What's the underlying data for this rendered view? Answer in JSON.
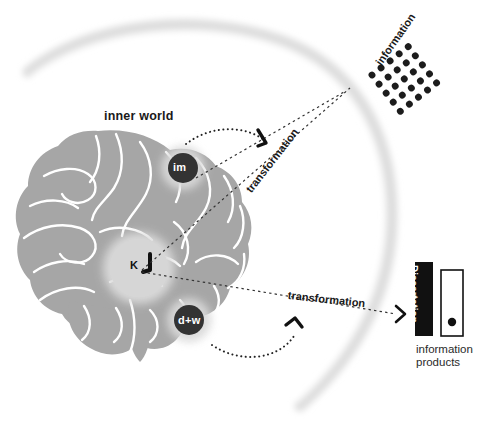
{
  "figure": {
    "type": "conceptual-diagram"
  },
  "labels": {
    "inner_world": "inner world",
    "information": "information",
    "transformation_upper": "transformation",
    "transformation_lower": "transformation",
    "information_products": "information\nproducts",
    "information_products_line1": "information",
    "information_products_line2": "products"
  },
  "nodes": [
    {
      "id": "im",
      "label": "im",
      "meaning": "information-mental-model-node"
    },
    {
      "id": "k",
      "label": "K",
      "meaning": "knowledge-node"
    },
    {
      "id": "dw",
      "label": "d+w",
      "meaning": "data-wisdom-node"
    }
  ],
  "artifacts": [
    {
      "id": "dissertation",
      "label": "Dissertation",
      "style": "black-spine"
    },
    {
      "id": "blank-product",
      "label": "",
      "style": "white-spine-with-dot"
    }
  ],
  "dot_grid": {
    "rows": 5,
    "cols": 5,
    "rotation_deg": -38,
    "dot_color": "#1c1c1c"
  },
  "colors": {
    "brain_fill": "#a6a6a6",
    "brain_lines": "#ffffff",
    "halo": "#cfcfcf",
    "node_dark": "#333333",
    "node_light": "#d4d4d4",
    "arc": "#dedede",
    "text": "#1a1a1a",
    "background": "#ffffff",
    "dissertation_spine": "#111111",
    "product_spine": "#ffffff"
  },
  "connections": [
    {
      "from": "im",
      "to": "information",
      "style": "dashed-arrow"
    },
    {
      "from": "k",
      "to": "information",
      "style": "dashed-arrow"
    },
    {
      "from": "k",
      "to": "dissertation",
      "style": "dashed-arrow"
    },
    {
      "from": "im",
      "to": "transformation_upper",
      "style": "dotted-curved-arrow"
    },
    {
      "from": "dw",
      "to": "transformation_lower",
      "style": "dotted-curved-arrow"
    }
  ]
}
